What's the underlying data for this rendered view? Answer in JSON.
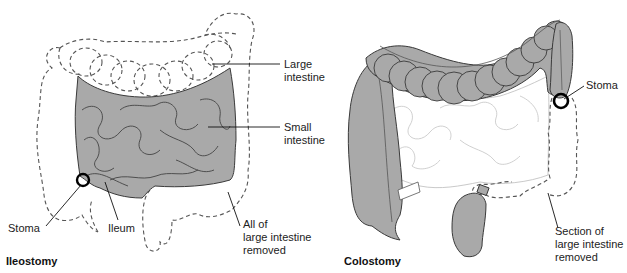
{
  "figure": {
    "panels": [
      {
        "id": "ileostomy",
        "caption": "Ileostomy",
        "labels": {
          "large_intestine": [
            "Large",
            "intestine"
          ],
          "small_intestine": [
            "Small",
            "intestine"
          ],
          "stoma": "Stoma",
          "ileum": "Ileum",
          "removed": [
            "All of",
            "large intestine",
            "removed"
          ]
        }
      },
      {
        "id": "colostomy",
        "caption": "Colostomy",
        "labels": {
          "stoma": "Stoma",
          "removed": [
            "Section of",
            "large intestine",
            "removed"
          ]
        }
      }
    ],
    "colors": {
      "organ_fill": "#a9a9a9",
      "outline": "#3a3a3a",
      "dashed": "#555555",
      "stoma_ring": "#000000",
      "background": "#ffffff"
    }
  }
}
